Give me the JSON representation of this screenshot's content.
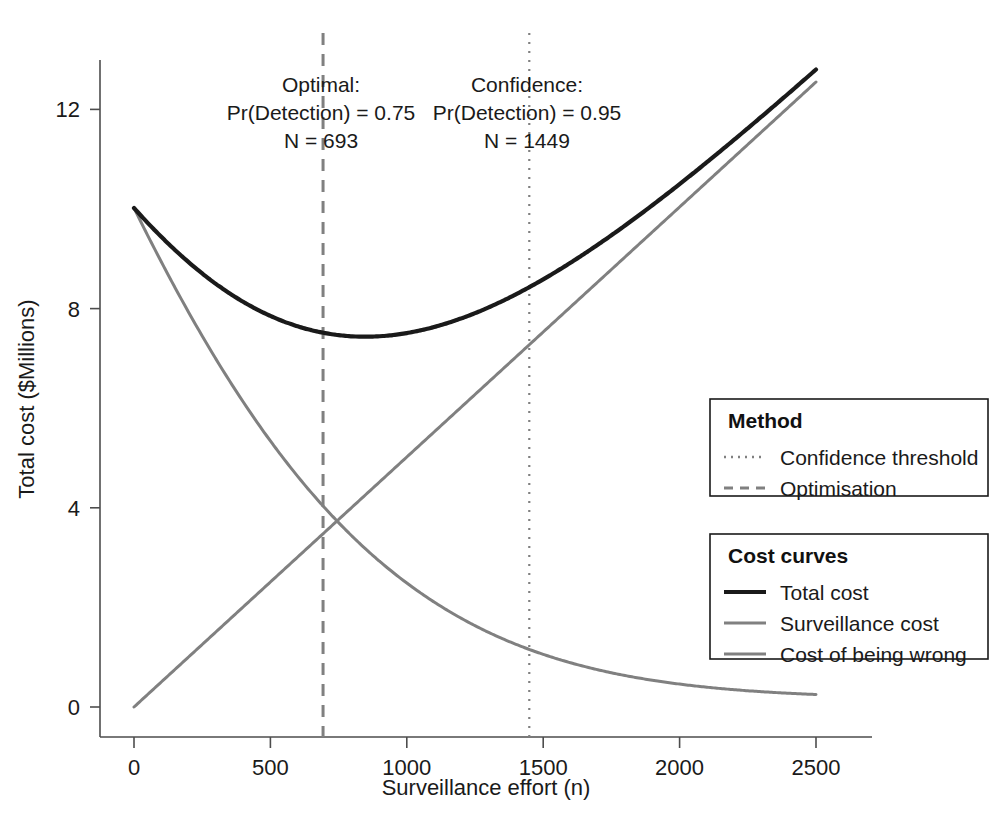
{
  "chart_data": {
    "type": "line",
    "title": "",
    "xlabel": "Surveillance effort (n)",
    "ylabel": "Total cost ($Millions)",
    "xlim": [
      0,
      2500
    ],
    "ylim": [
      0,
      13.2
    ],
    "xticks": [
      "0",
      "500",
      "1000",
      "1500",
      "2000",
      "2500"
    ],
    "xtick_values": [
      0,
      500,
      1000,
      1500,
      2000,
      2500
    ],
    "yticks": [
      "0",
      "4",
      "8",
      "12"
    ],
    "ytick_values": [
      0,
      4,
      8,
      12
    ],
    "grid": false,
    "legend_position": "right",
    "x": [
      0,
      100,
      200,
      300,
      400,
      500,
      600,
      693,
      800,
      900,
      1000,
      1100,
      1200,
      1300,
      1449,
      1500,
      1600,
      1700,
      1800,
      1900,
      2000,
      2100,
      2200,
      2300,
      2400,
      2500
    ],
    "series": [
      {
        "name": "Total cost",
        "color": "#1a1a1a",
        "values": [
          10.02,
          8.86,
          7.95,
          7.24,
          6.71,
          6.34,
          6.1,
          5.99,
          6.0,
          6.08,
          6.21,
          6.39,
          6.6,
          6.85,
          7.27,
          7.42,
          7.72,
          8.04,
          8.37,
          8.72,
          9.07,
          9.43,
          9.79,
          10.16,
          10.54,
          10.91
        ]
      },
      {
        "name": "Surveillance cost",
        "color": "#808080",
        "values": [
          0.0,
          0.5,
          1.0,
          1.5,
          2.0,
          2.51,
          3.01,
          3.48,
          4.01,
          4.52,
          5.02,
          5.52,
          6.02,
          6.52,
          7.27,
          7.53,
          8.03,
          8.53,
          9.03,
          9.54,
          10.04,
          10.54,
          11.04,
          11.54,
          12.04,
          12.55
        ]
      },
      {
        "name": "Cost of being wrong",
        "color": "#808080",
        "values": [
          10.02,
          8.36,
          6.95,
          5.74,
          4.71,
          3.83,
          3.09,
          2.51,
          1.99,
          1.56,
          1.19,
          0.87,
          0.58,
          0.33,
          0.0,
          0.0,
          0.0,
          0.0,
          0.0,
          0.0,
          0.0,
          0.0,
          0.0,
          0.0,
          0.0,
          0.0
        ]
      }
    ],
    "annotations": [
      {
        "name": "optimisation-marker",
        "x": 693,
        "style": "dashed",
        "color": "#808080",
        "lines": [
          "Optimal:",
          "Pr(Detection) = 0.75",
          "N = 693"
        ]
      },
      {
        "name": "confidence-marker",
        "x": 1449,
        "style": "dotted",
        "color": "#808080",
        "lines": [
          "Confidence:",
          "Pr(Detection) = 0.95",
          "N = 1449"
        ]
      }
    ]
  },
  "annotations": {
    "optimal": {
      "line1": "Optimal:",
      "line2": "Pr(Detection) = 0.75",
      "line3": "N = 693"
    },
    "confidence": {
      "line1": "Confidence:",
      "line2": "Pr(Detection) = 0.95",
      "line3": "N = 1449"
    }
  },
  "axes": {
    "x_title": "Surveillance effort (n)",
    "y_title": "Total cost ($Millions)",
    "x_ticks": [
      "0",
      "500",
      "1000",
      "1500",
      "2000",
      "2500"
    ],
    "y_ticks": [
      "0",
      "4",
      "8",
      "12"
    ]
  },
  "legends": [
    {
      "name": "method-legend",
      "title": "Method",
      "items": [
        {
          "label": "Confidence threshold",
          "style": "dotted",
          "color": "#808080"
        },
        {
          "label": "Optimisation",
          "style": "dashed",
          "color": "#808080"
        }
      ]
    },
    {
      "name": "cost-curves-legend",
      "title": "Cost curves",
      "items": [
        {
          "label": "Total cost",
          "style": "solid",
          "color": "#1a1a1a"
        },
        {
          "label": "Surveillance cost",
          "style": "solid",
          "color": "#808080"
        },
        {
          "label": "Cost of being wrong",
          "style": "solid",
          "color": "#808080"
        }
      ]
    }
  ]
}
